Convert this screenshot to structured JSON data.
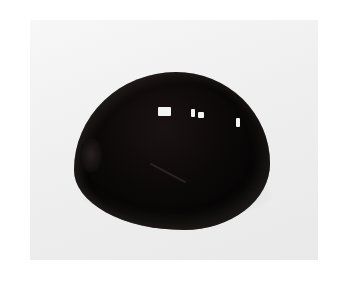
{
  "image": {
    "description": "Photograph of a polished dark cabochon gemstone on a light background",
    "subject": "dark cabochon gemstone",
    "background_color": "#efefef",
    "stone_color": "#0b0808",
    "highlight_color": "#f4f4f4"
  }
}
